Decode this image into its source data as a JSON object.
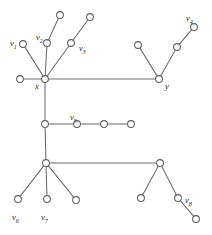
{
  "figure": {
    "width": 212,
    "height": 235,
    "background_color": "#ffffff",
    "node_stroke_color": "#5f5f5f",
    "node_fill_color": "#ffffff",
    "edge_color": "#6b6b6b",
    "label_color": "#1b1b1b",
    "node_radius": 3.4
  },
  "chart_data": {
    "type": "diagram",
    "subtype": "node-link-tree",
    "title": "",
    "nodes": [
      {
        "id": "n_x",
        "label": "x",
        "label_text": "x",
        "x": 45,
        "y": 79,
        "label_x": 35,
        "label_y": 82
      },
      {
        "id": "n_y",
        "label": "y",
        "label_text": "y",
        "x": 159,
        "y": 79,
        "label_x": 165,
        "label_y": 82
      },
      {
        "id": "n_v1",
        "label": "v1",
        "label_text": "v",
        "sub": "1",
        "x": 23,
        "y": 44,
        "label_x": 10,
        "label_y": 39
      },
      {
        "id": "n_v2",
        "label": "v2",
        "label_text": "v",
        "sub": "2",
        "x": 47,
        "y": 43,
        "label_x": 36,
        "label_y": 33
      },
      {
        "id": "n_v3",
        "label": "v3",
        "label_text": "v",
        "sub": "3",
        "x": 71,
        "y": 43,
        "label_x": 79,
        "label_y": 44
      },
      {
        "id": "n_v4",
        "label": "v4",
        "label_text": "v",
        "sub": "4",
        "x": 194,
        "y": 27,
        "label_x": 186,
        "label_y": 14
      },
      {
        "id": "n_v5",
        "label": "v5",
        "label_text": "v",
        "sub": "5",
        "x": 77,
        "y": 124,
        "label_x": 70,
        "label_y": 113
      },
      {
        "id": "n_v6",
        "label": "v6",
        "label_text": "v",
        "sub": "6",
        "x": 18,
        "y": 199,
        "label_x": 12,
        "label_y": 213
      },
      {
        "id": "n_v7",
        "label": "v7",
        "label_text": "v",
        "sub": "7",
        "x": 47,
        "y": 199,
        "label_x": 41,
        "label_y": 213
      },
      {
        "id": "n_v8",
        "label": "v8",
        "label_text": "v",
        "sub": "8",
        "x": 178,
        "y": 198,
        "label_x": 185,
        "label_y": 196
      },
      {
        "id": "n_a1",
        "label": "",
        "x": 60,
        "y": 15,
        "label_x": 0,
        "label_y": 0
      },
      {
        "id": "n_a2",
        "label": "",
        "x": 90,
        "y": 17,
        "label_x": 0,
        "label_y": 0
      },
      {
        "id": "n_a3",
        "label": "",
        "x": 20,
        "y": 79,
        "label_x": 0,
        "label_y": 0
      },
      {
        "id": "n_b1",
        "label": "",
        "x": 138,
        "y": 45,
        "label_x": 0,
        "label_y": 0
      },
      {
        "id": "n_b2",
        "label": "",
        "x": 177,
        "y": 47,
        "label_x": 0,
        "label_y": 0
      },
      {
        "id": "n_c1",
        "label": "",
        "x": 45,
        "y": 124,
        "label_x": 0,
        "label_y": 0
      },
      {
        "id": "n_c2",
        "label": "",
        "x": 104,
        "y": 124,
        "label_x": 0,
        "label_y": 0
      },
      {
        "id": "n_c3",
        "label": "",
        "x": 131,
        "y": 124,
        "label_x": 0,
        "label_y": 0
      },
      {
        "id": "n_h",
        "label": "",
        "x": 46,
        "y": 163,
        "label_x": 0,
        "label_y": 0
      },
      {
        "id": "n_d1",
        "label": "",
        "x": 76,
        "y": 200,
        "label_x": 0,
        "label_y": 0
      },
      {
        "id": "n_r",
        "label": "",
        "x": 160,
        "y": 163,
        "label_x": 0,
        "label_y": 0
      },
      {
        "id": "n_e1",
        "label": "",
        "x": 141,
        "y": 198,
        "label_x": 0,
        "label_y": 0
      },
      {
        "id": "n_e2",
        "label": "",
        "x": 196,
        "y": 219,
        "label_x": 0,
        "label_y": 0
      }
    ],
    "edges": [
      {
        "source": "n_x",
        "target": "n_v1"
      },
      {
        "source": "n_x",
        "target": "n_v2"
      },
      {
        "source": "n_x",
        "target": "n_v3"
      },
      {
        "source": "n_x",
        "target": "n_a3"
      },
      {
        "source": "n_x",
        "target": "n_y"
      },
      {
        "source": "n_x",
        "target": "n_c1"
      },
      {
        "source": "n_v2",
        "target": "n_a1"
      },
      {
        "source": "n_v3",
        "target": "n_a2"
      },
      {
        "source": "n_y",
        "target": "n_b1"
      },
      {
        "source": "n_y",
        "target": "n_b2"
      },
      {
        "source": "n_b2",
        "target": "n_v4"
      },
      {
        "source": "n_c1",
        "target": "n_v5"
      },
      {
        "source": "n_v5",
        "target": "n_c2"
      },
      {
        "source": "n_c2",
        "target": "n_c3"
      },
      {
        "source": "n_c1",
        "target": "n_h"
      },
      {
        "source": "n_h",
        "target": "n_v6"
      },
      {
        "source": "n_h",
        "target": "n_v7"
      },
      {
        "source": "n_h",
        "target": "n_d1"
      },
      {
        "source": "n_h",
        "target": "n_r"
      },
      {
        "source": "n_r",
        "target": "n_e1"
      },
      {
        "source": "n_r",
        "target": "n_v8"
      },
      {
        "source": "n_v8",
        "target": "n_e2"
      }
    ],
    "labels": [
      "x",
      "y",
      "v1",
      "v2",
      "v3",
      "v4",
      "v5",
      "v6",
      "v7",
      "v8"
    ]
  }
}
